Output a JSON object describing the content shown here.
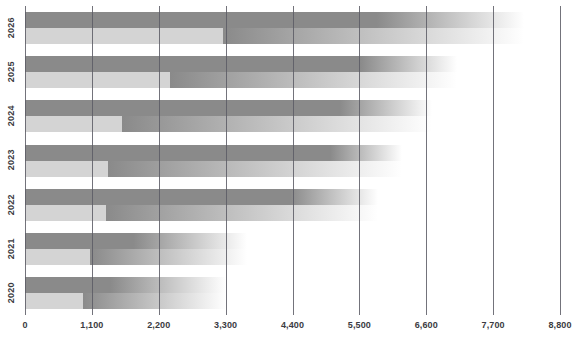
{
  "chart_data": {
    "type": "bar",
    "title": "",
    "subtitle": "",
    "xlabel": "",
    "ylabel": "",
    "orientation": "horizontal",
    "grid": true,
    "legend": "none",
    "xlim": [
      0,
      8800
    ],
    "x_ticks": [
      "0",
      "1,100",
      "2,200",
      "3,300",
      "4,400",
      "5,500",
      "6,600",
      "7,700",
      "8,800"
    ],
    "x_tick_values": [
      0,
      1100,
      2200,
      3300,
      4400,
      5500,
      6600,
      7700,
      8800
    ],
    "categories": [
      "2020",
      "2021",
      "2022",
      "2023",
      "2024",
      "2025",
      "2026"
    ],
    "series": [
      {
        "name": "series-dark",
        "color": "#8a8a8a",
        "values": [
          1400,
          1780,
          4360,
          5020,
          5180,
          5510,
          5780
        ]
      },
      {
        "name": "series-light",
        "color": "#d4d4d4",
        "values": [
          950,
          1070,
          1330,
          1370,
          1600,
          2390,
          3260
        ]
      }
    ],
    "fade_extent": [
      3300,
      3650,
      5800,
      6200,
      6700,
      7100,
      8200
    ],
    "colors": {
      "dark": "#8a8a8a",
      "light": "#d4d4d4",
      "gridline": "#5a5a64",
      "axis_text": "#3b3b42",
      "background": "#ffffff"
    }
  }
}
